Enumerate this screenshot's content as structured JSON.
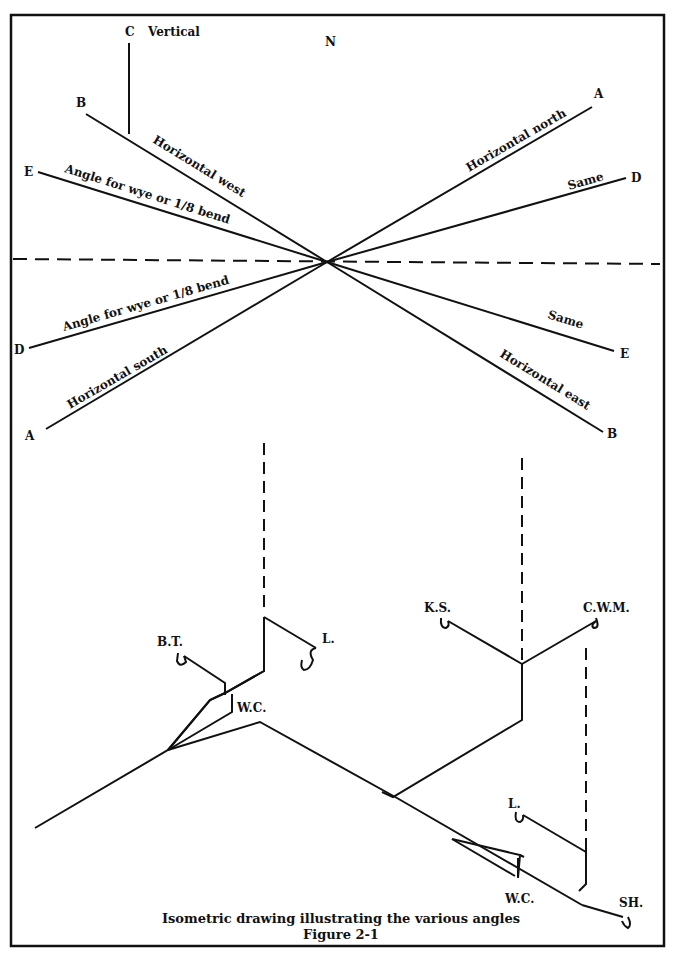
{
  "figure": {
    "caption_line1": "Isometric drawing illustrating the various angles",
    "caption_line2": "Figure 2-1"
  },
  "compass": {
    "north": "N",
    "vertical_letter": "C",
    "vertical_label": "Vertical"
  },
  "angle_diagram": {
    "center": [
      327,
      262
    ],
    "lines": [
      {
        "id": "A-north",
        "letter": "A",
        "label": "Horizontal north"
      },
      {
        "id": "D-same",
        "letter": "D",
        "label": "Same"
      },
      {
        "id": "B-west",
        "letter": "B",
        "label": "Horizontal west"
      },
      {
        "id": "E-wye",
        "letter": "E",
        "label": "Angle for wye or 1/8 bend"
      },
      {
        "id": "D-wye",
        "letter": "D",
        "label": "Angle for wye or 1/8 bend"
      },
      {
        "id": "A-south",
        "letter": "A",
        "label": "Horizontal south"
      },
      {
        "id": "E-same",
        "letter": "E",
        "label": "Same"
      },
      {
        "id": "B-east",
        "letter": "B",
        "label": "Horizontal east"
      }
    ]
  },
  "fixtures": {
    "bt": "B.T.",
    "l_upper": "L.",
    "wc_upper": "W.C.",
    "ks": "K.S.",
    "cwm": "C.W.M.",
    "l_lower": "L.",
    "wc_lower": "W.C.",
    "sh": "SH."
  }
}
